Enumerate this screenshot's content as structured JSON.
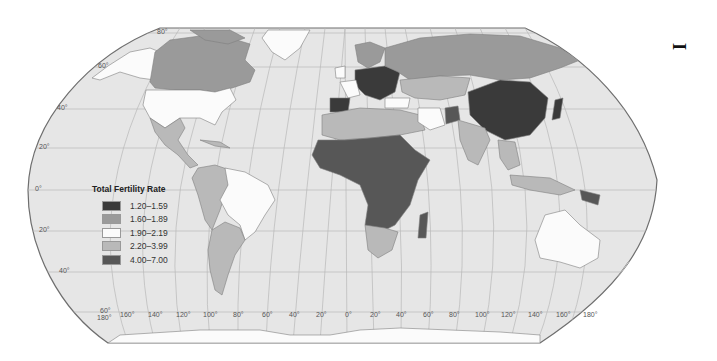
{
  "map": {
    "projection": "Robinson",
    "colors": {
      "ocean": "#e6e6e6",
      "graticule": "#b5b5b5",
      "border": "#8a8a8a",
      "outline": "#6e6e6e",
      "no_data": "#e9e9e9"
    },
    "latitude_labels": [
      {
        "text": "80°",
        "x": 157,
        "y": 30
      },
      {
        "text": "60°",
        "x": 98,
        "y": 64
      },
      {
        "text": "40°",
        "x": 57,
        "y": 106
      },
      {
        "text": "20°",
        "x": 39,
        "y": 145
      },
      {
        "text": "0°",
        "x": 35,
        "y": 186
      },
      {
        "text": "20°",
        "x": 39,
        "y": 228
      },
      {
        "text": "40°",
        "x": 59,
        "y": 270
      },
      {
        "text": "60°",
        "x": 100,
        "y": 309
      }
    ],
    "longitude_labels": [
      {
        "text": "180°",
        "x": 97,
        "y": 316
      },
      {
        "text": "160°",
        "x": 120,
        "y": 313
      },
      {
        "text": "140°",
        "x": 148,
        "y": 313
      },
      {
        "text": "120°",
        "x": 176,
        "y": 313
      },
      {
        "text": "100°",
        "x": 203,
        "y": 313
      },
      {
        "text": "80°",
        "x": 233,
        "y": 313
      },
      {
        "text": "60°",
        "x": 262,
        "y": 313
      },
      {
        "text": "40°",
        "x": 289,
        "y": 313
      },
      {
        "text": "20°",
        "x": 316,
        "y": 313
      },
      {
        "text": "0°",
        "x": 345,
        "y": 313
      },
      {
        "text": "20°",
        "x": 370,
        "y": 313
      },
      {
        "text": "40°",
        "x": 396,
        "y": 313
      },
      {
        "text": "60°",
        "x": 423,
        "y": 313
      },
      {
        "text": "80°",
        "x": 449,
        "y": 313
      },
      {
        "text": "100°",
        "x": 475,
        "y": 313
      },
      {
        "text": "120°",
        "x": 501,
        "y": 313
      },
      {
        "text": "140°",
        "x": 528,
        "y": 313
      },
      {
        "text": "160°",
        "x": 556,
        "y": 313
      },
      {
        "text": "180°",
        "x": 583,
        "y": 313
      }
    ]
  },
  "legend": {
    "title": "Total Fertility Rate",
    "items": [
      {
        "label": "1.20–1.59",
        "color": "#3a3a3a"
      },
      {
        "label": "1.60–1.89",
        "color": "#9a9a9a"
      },
      {
        "label": "1.90–2.19",
        "color": "#fbfbfb"
      },
      {
        "label": "2.20–3.99",
        "color": "#b9b9b9"
      },
      {
        "label": "4.00–7.00",
        "color": "#575757"
      }
    ]
  },
  "regions": [
    {
      "name": "Canada",
      "class": "1.60–1.89"
    },
    {
      "name": "United States",
      "class": "1.90–2.19"
    },
    {
      "name": "Mexico & Central America",
      "class": "2.20–3.99"
    },
    {
      "name": "Brazil",
      "class": "1.90–2.19"
    },
    {
      "name": "Andean South America",
      "class": "2.20–3.99"
    },
    {
      "name": "Argentina",
      "class": "2.20–3.99"
    },
    {
      "name": "Greenland",
      "class": "1.90–2.19"
    },
    {
      "name": "Central & Eastern Europe",
      "class": "1.20–1.59"
    },
    {
      "name": "Iberia",
      "class": "1.20–1.59"
    },
    {
      "name": "France",
      "class": "1.90–2.19"
    },
    {
      "name": "Russia",
      "class": "1.60–1.89"
    },
    {
      "name": "Central Asia",
      "class": "2.20–3.99"
    },
    {
      "name": "Iran",
      "class": "1.90–2.19"
    },
    {
      "name": "Afghanistan",
      "class": "4.00–7.00"
    },
    {
      "name": "China",
      "class": "1.20–1.59"
    },
    {
      "name": "India",
      "class": "2.20–3.99"
    },
    {
      "name": "North Africa & Middle East",
      "class": "2.20–3.99"
    },
    {
      "name": "Sub-Saharan Africa",
      "class": "4.00–7.00"
    },
    {
      "name": "Southern Africa",
      "class": "2.20–3.99"
    },
    {
      "name": "Southeast Asia",
      "class": "2.20–3.99"
    },
    {
      "name": "Australia",
      "class": "1.90–2.19"
    },
    {
      "name": "New Zealand",
      "class": "1.90–2.19"
    }
  ],
  "page_marker": "I"
}
